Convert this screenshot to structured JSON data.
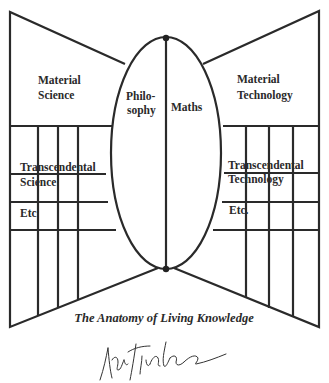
{
  "diagram": {
    "title": "The Anatomy of Living Knowledge",
    "center": {
      "left_label_line1": "Philo-",
      "left_label_line2": "sophy",
      "right_label": "Maths"
    },
    "left_panel": {
      "top_label_line1": "Material",
      "top_label_line2": "Science",
      "mid_label_line1": "Transcendental",
      "mid_label_line2": "Science",
      "low_label": "Etc"
    },
    "right_panel": {
      "top_label_line1": "Material",
      "top_label_line2": "Technology",
      "mid_label_line1": "Transcendental",
      "mid_label_line2": "Technology",
      "low_label": "Etc."
    },
    "signature": "handwritten signature",
    "colors": {
      "ink": "#2a2a2a",
      "background": "#ffffff"
    }
  }
}
